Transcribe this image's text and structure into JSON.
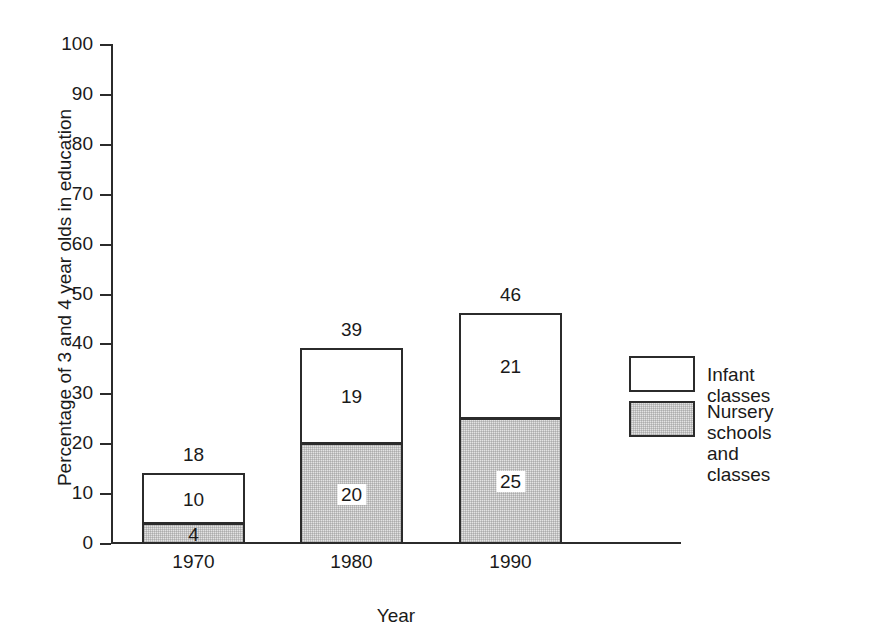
{
  "chart_data": {
    "type": "bar",
    "subtype": "stacked",
    "title": "",
    "xlabel": "Year",
    "ylabel": "Percentage of 3 and 4 year olds in education",
    "categories": [
      "1970",
      "1980",
      "1990"
    ],
    "ylim": [
      0,
      100
    ],
    "y_ticks": [
      0,
      10,
      20,
      30,
      40,
      50,
      60,
      70,
      80,
      90,
      100
    ],
    "y_tick_labels": [
      "0",
      "10",
      "20",
      "30",
      "40",
      "50",
      "60",
      "70",
      "80",
      "90",
      "100"
    ],
    "grid": false,
    "legend_position": "right",
    "series": [
      {
        "name": "Nursery schools and classes",
        "color": "#e3e3e3",
        "values": [
          4,
          20,
          25
        ],
        "value_labels": [
          "4",
          "20",
          "25"
        ]
      },
      {
        "name": "Infant classes",
        "color": "#ffffff",
        "values": [
          10,
          19,
          21
        ],
        "value_labels": [
          "10",
          "19",
          "21"
        ]
      }
    ],
    "totals": [
      18,
      39,
      46
    ],
    "total_labels": [
      "18",
      "39",
      "46"
    ]
  },
  "axes": {
    "y_title": "Percentage of 3 and 4 year olds in education",
    "x_title": "Year",
    "y_ticks": [
      "100",
      "90",
      "80",
      "70",
      "60",
      "50",
      "40",
      "30",
      "20",
      "10",
      "0"
    ]
  },
  "bars": [
    {
      "category": "1970",
      "total_label": "18",
      "infant_label": "10",
      "nursery_label": "4"
    },
    {
      "category": "1980",
      "total_label": "39",
      "infant_label": "19",
      "nursery_label": "20"
    },
    {
      "category": "1990",
      "total_label": "46",
      "infant_label": "21",
      "nursery_label": "25"
    }
  ],
  "legend": {
    "items": [
      {
        "label": "Infant classes",
        "swatch": "white"
      },
      {
        "label": "Nursery schools\nand classes",
        "swatch": "grey"
      }
    ]
  },
  "colors": {
    "ink": "#1a1a1a",
    "line": "#2b2b2b",
    "nursery_fill": "#e3e3e3",
    "infant_fill": "#ffffff",
    "background": "#ffffff"
  }
}
